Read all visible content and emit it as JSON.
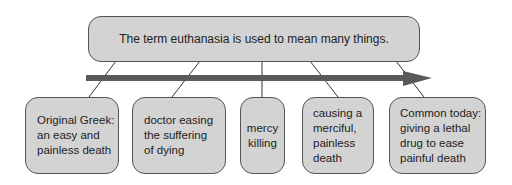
{
  "diagram": {
    "title": "The term euthanasia is used to mean many things.",
    "arrow_color": "#5a5a5a",
    "box_fill": "#d3d3d3",
    "meanings": [
      {
        "text": "Original Greek:\nan easy and\npainless death"
      },
      {
        "text": "doctor easing\nthe suffering\nof dying"
      },
      {
        "text": "mercy\nkilling"
      },
      {
        "text": "causing a\nmerciful,\npainless\ndeath"
      },
      {
        "text": "Common today:\ngiving a lethal\ndrug to ease\npainful death"
      }
    ]
  }
}
